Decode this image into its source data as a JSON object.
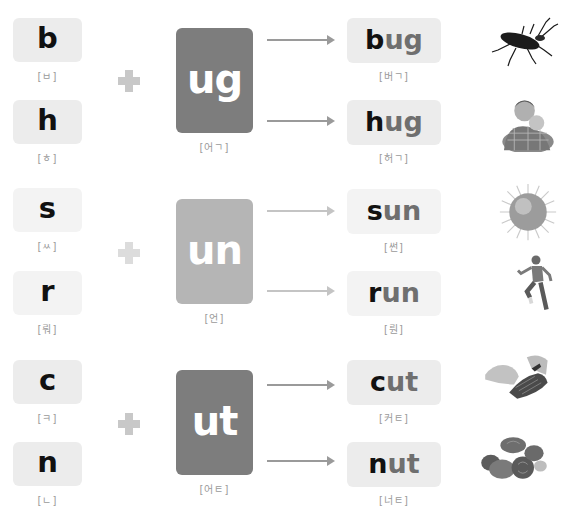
{
  "groups": [
    {
      "rime": "ug",
      "rime_pron": "[어ㄱ]",
      "faded": false,
      "rows": [
        {
          "onset": "b",
          "onset_pron": "[ㅂ]",
          "word_onset": "b",
          "word_rime": "ug",
          "word_pron": "[버ㄱ]",
          "picture": "bug-image"
        },
        {
          "onset": "h",
          "onset_pron": "[ㅎ]",
          "word_onset": "h",
          "word_rime": "ug",
          "word_pron": "[허ㄱ]",
          "picture": "hug-image"
        }
      ]
    },
    {
      "rime": "un",
      "rime_pron": "[언]",
      "faded": true,
      "rows": [
        {
          "onset": "s",
          "onset_pron": "[ㅆ]",
          "word_onset": "s",
          "word_rime": "un",
          "word_pron": "[썬]",
          "picture": "sun-image"
        },
        {
          "onset": "r",
          "onset_pron": "[뤄]",
          "word_onset": "r",
          "word_rime": "un",
          "word_pron": "[뤈]",
          "picture": "run-image"
        }
      ]
    },
    {
      "rime": "ut",
      "rime_pron": "[어ㅌ]",
      "faded": false,
      "rows": [
        {
          "onset": "c",
          "onset_pron": "[ㅋ]",
          "word_onset": "c",
          "word_rime": "ut",
          "word_pron": "[커ㅌ]",
          "picture": "cut-image"
        },
        {
          "onset": "n",
          "onset_pron": "[ㄴ]",
          "word_onset": "n",
          "word_rime": "ut",
          "word_pron": "[너ㅌ]",
          "picture": "nut-image"
        }
      ]
    }
  ],
  "colors": {
    "card": "#7d7d7d",
    "card_faded": "#b5b5b5",
    "box": "#ececec",
    "onset_text": "#111111",
    "rime_text": "#6f6f6f",
    "pron_text": "#9a9a9a"
  }
}
